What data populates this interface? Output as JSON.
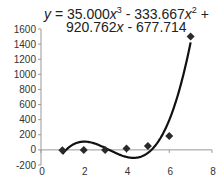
{
  "chart_data": {
    "type": "scatter",
    "title": "",
    "xlabel": "",
    "ylabel": "",
    "xlim": [
      0,
      8
    ],
    "ylim": [
      -200,
      1600
    ],
    "x_ticks": [
      0,
      2,
      4,
      6,
      8
    ],
    "y_ticks": [
      -200,
      0,
      200,
      400,
      600,
      800,
      1000,
      1200,
      1400,
      1600
    ],
    "grid": false,
    "legend": null,
    "series": [
      {
        "name": "data",
        "marker": "diamond",
        "x": [
          1,
          2,
          3,
          4,
          5,
          6,
          7
        ],
        "y": [
          -5,
          0,
          0,
          20,
          50,
          185,
          1500
        ]
      }
    ],
    "trendline": {
      "type": "polynomial",
      "order": 3,
      "coefficients": [
        35.0,
        -333.667,
        920.762,
        -677.714
      ],
      "x_range": [
        1,
        7
      ]
    },
    "annotations": [
      "y = 35.000x³ - 333.667x² + 920.762x - 677.714"
    ]
  },
  "equation": {
    "line1": "y = 35.000x",
    "line1_exp1": "3",
    "line1_mid": " - 333.667x",
    "line1_exp2": "2",
    "line1_end": " +",
    "line2": "920.762x - 677.714"
  },
  "colors": {
    "marker": "#2a2a2a",
    "curve": "#111111",
    "axis": "#999999"
  }
}
